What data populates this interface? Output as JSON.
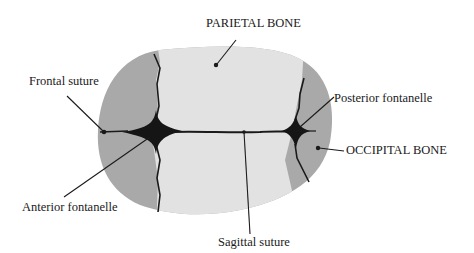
{
  "colors": {
    "background": "#ffffff",
    "parietal_bone": "#e2e2e2",
    "frontal_occipital_bone": "#a9a9a9",
    "fontanelle": "#151515",
    "suture": "#1a1a1a",
    "label_text": "#1a1a1a"
  },
  "labels": {
    "parietal_bone": "PARIETAL BONE",
    "frontal_suture": "Frontal suture",
    "posterior_fontanelle": "Posterior fontanelle",
    "occipital_bone": "OCCIPITAL BONE",
    "anterior_fontanelle": "Anterior fontanelle",
    "sagittal_suture": "Sagittal suture"
  }
}
